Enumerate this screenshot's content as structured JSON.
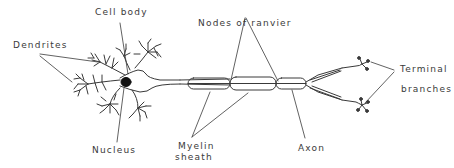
{
  "diagram": {
    "colors": {
      "line": "#3a3a3a",
      "nucleus": "#111111",
      "background": "#ffffff"
    },
    "labels": {
      "cell_body": "Cell body",
      "dendrites": "Dendrites",
      "nucleus": "Nucleus",
      "nodes_of_ranvier": "Nodes of ranvier",
      "myelin_sheath_line1": "Myelin",
      "myelin_sheath_line2": "sheath",
      "axon": "Axon",
      "terminal_branches_line1": "Terminal",
      "terminal_branches_line2": "branches"
    }
  }
}
